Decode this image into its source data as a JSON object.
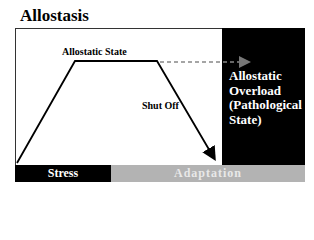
{
  "title": "Allostasis",
  "labels": {
    "allostatic_state": "Allostatic State",
    "shut_off": "Shut Off",
    "allostatic_overload": [
      "Allostatic",
      "Overload",
      "(Pathological",
      "State)"
    ]
  },
  "phases": {
    "stress": "Stress",
    "adaptation": "Adaptation"
  },
  "colors": {
    "overload_box": "#000000",
    "stress_bar": "#000000",
    "adaptation_bar": "#b3b3b3",
    "dashed_line": "#888888"
  }
}
